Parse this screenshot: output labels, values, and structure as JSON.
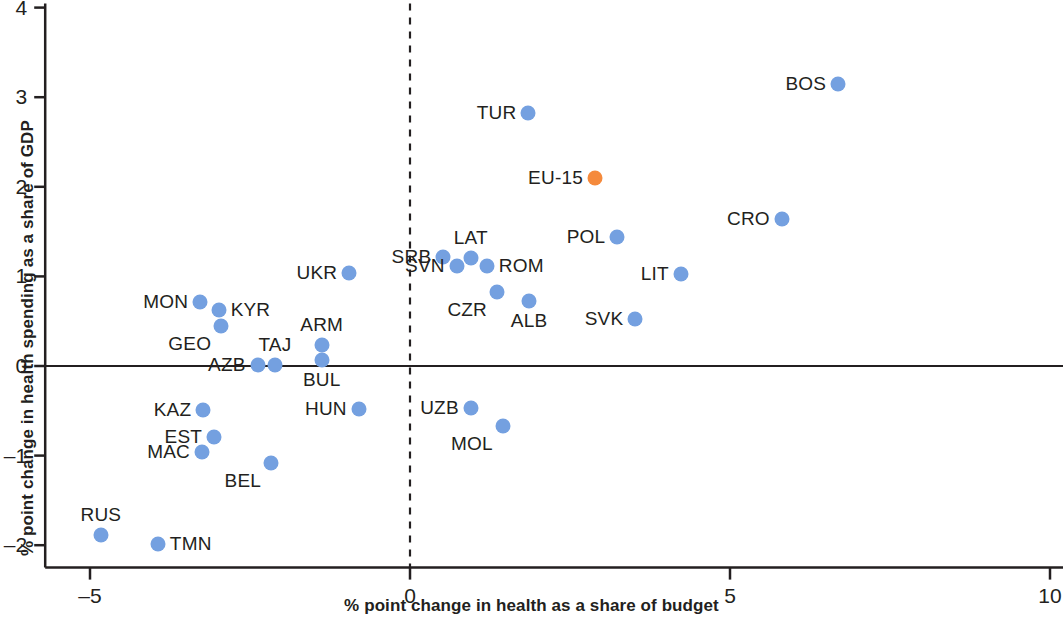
{
  "chart_data": {
    "type": "scatter",
    "title": "",
    "xlabel": "% point change in health as a share of budget",
    "ylabel": "% point change in health spending as a share of GDP",
    "xlim": [
      -5.7,
      10.2
    ],
    "ylim": [
      -2.25,
      4.0
    ],
    "xticks": [
      -5,
      0,
      5,
      10
    ],
    "xtick_labels": [
      "–5",
      "0",
      "5",
      "10"
    ],
    "yticks": [
      -2,
      -1,
      0,
      1,
      2,
      3,
      4
    ],
    "ytick_labels": [
      "–2",
      "–1",
      "0",
      "1",
      "2",
      "3",
      "4"
    ],
    "grid": false,
    "legend": "none",
    "reference_lines": [
      {
        "axis": "y",
        "value": 0,
        "style": "solid",
        "color": "#231f20"
      },
      {
        "axis": "x",
        "value": 0,
        "style": "dashed",
        "color": "#231f20"
      }
    ],
    "colors": {
      "point": "#74a0e0",
      "highlight": "#f58a3c",
      "axis": "#231f20",
      "text": "#231f20",
      "background": "#ffffff"
    },
    "points": [
      {
        "label": "BOS",
        "x": 6.69,
        "y": 3.15,
        "highlight": false,
        "label_side": "left"
      },
      {
        "label": "TUR",
        "x": 1.85,
        "y": 2.82,
        "highlight": false,
        "label_side": "left"
      },
      {
        "label": "EU-15",
        "x": 2.89,
        "y": 2.1,
        "highlight": true,
        "label_side": "left"
      },
      {
        "label": "CRO",
        "x": 5.81,
        "y": 1.64,
        "highlight": false,
        "label_side": "left"
      },
      {
        "label": "POL",
        "x": 3.24,
        "y": 1.44,
        "highlight": false,
        "label_side": "left"
      },
      {
        "label": "LAT",
        "x": 0.95,
        "y": 1.2,
        "highlight": false,
        "label_side": "above"
      },
      {
        "label": "SRB",
        "x": 0.52,
        "y": 1.22,
        "highlight": false,
        "label_side": "left"
      },
      {
        "label": "SVN",
        "x": 0.73,
        "y": 1.12,
        "highlight": false,
        "label_side": "left"
      },
      {
        "label": "ROM",
        "x": 1.2,
        "y": 1.12,
        "highlight": false,
        "label_side": "right"
      },
      {
        "label": "UKR",
        "x": -0.95,
        "y": 1.04,
        "highlight": false,
        "label_side": "left"
      },
      {
        "label": "LIT",
        "x": 4.23,
        "y": 1.03,
        "highlight": false,
        "label_side": "left"
      },
      {
        "label": "CZR",
        "x": 1.36,
        "y": 0.83,
        "highlight": false,
        "label_side": "belowleft"
      },
      {
        "label": "ALB",
        "x": 1.86,
        "y": 0.72,
        "highlight": false,
        "label_side": "below"
      },
      {
        "label": "MON",
        "x": -3.28,
        "y": 0.71,
        "highlight": false,
        "label_side": "left"
      },
      {
        "label": "KYR",
        "x": -2.99,
        "y": 0.63,
        "highlight": false,
        "label_side": "right"
      },
      {
        "label": "SVK",
        "x": 3.52,
        "y": 0.53,
        "highlight": false,
        "label_side": "left"
      },
      {
        "label": "GEO",
        "x": -2.95,
        "y": 0.45,
        "highlight": false,
        "label_side": "belowleft"
      },
      {
        "label": "ARM",
        "x": -1.38,
        "y": 0.23,
        "highlight": false,
        "label_side": "above"
      },
      {
        "label": "BUL",
        "x": -1.38,
        "y": 0.07,
        "highlight": false,
        "label_side": "below"
      },
      {
        "label": "AZB",
        "x": -2.38,
        "y": 0.01,
        "highlight": false,
        "label_side": "left"
      },
      {
        "label": "TAJ",
        "x": -2.11,
        "y": 0.01,
        "highlight": false,
        "label_side": "above"
      },
      {
        "label": "UZB",
        "x": 0.95,
        "y": -0.47,
        "highlight": false,
        "label_side": "left"
      },
      {
        "label": "KAZ",
        "x": -3.23,
        "y": -0.49,
        "highlight": false,
        "label_side": "left"
      },
      {
        "label": "HUN",
        "x": -0.8,
        "y": -0.48,
        "highlight": false,
        "label_side": "left"
      },
      {
        "label": "MOL",
        "x": 1.45,
        "y": -0.67,
        "highlight": false,
        "label_side": "belowleft"
      },
      {
        "label": "EST",
        "x": -3.06,
        "y": -0.79,
        "highlight": false,
        "label_side": "left"
      },
      {
        "label": "MAC",
        "x": -3.25,
        "y": -0.96,
        "highlight": false,
        "label_side": "left"
      },
      {
        "label": "BEL",
        "x": -2.17,
        "y": -1.08,
        "highlight": false,
        "label_side": "belowleft"
      },
      {
        "label": "RUS",
        "x": -4.83,
        "y": -1.89,
        "highlight": false,
        "label_side": "above"
      },
      {
        "label": "TMN",
        "x": -3.94,
        "y": -1.99,
        "highlight": false,
        "label_side": "right"
      }
    ]
  }
}
